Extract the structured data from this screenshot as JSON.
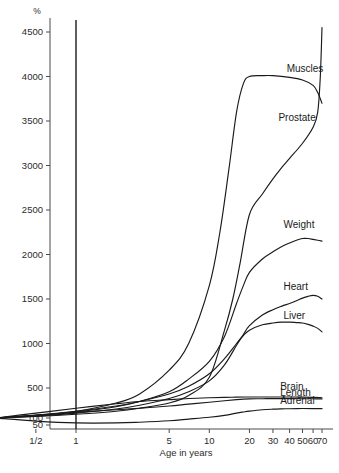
{
  "chart_data": {
    "type": "line",
    "title": "",
    "xlabel": "Age in years",
    "ylabel": "%",
    "xscale": "log",
    "yscale": "linear",
    "ylim": [
      50,
      4700
    ],
    "xlim": [
      0.25,
      75
    ],
    "grid": false,
    "legend": "inline-labels",
    "y_ticks": [
      {
        "value": 50,
        "label": "50"
      },
      {
        "value": 100,
        "label": "100"
      },
      {
        "value": 500,
        "label": "500"
      },
      {
        "value": 1000,
        "label": "1000"
      },
      {
        "value": 1500,
        "label": "1500"
      },
      {
        "value": 2000,
        "label": "2000"
      },
      {
        "value": 2500,
        "label": "2500"
      },
      {
        "value": 3000,
        "label": "3000"
      },
      {
        "value": 3500,
        "label": "3500"
      },
      {
        "value": 4000,
        "label": "4000"
      },
      {
        "value": 4500,
        "label": "4500"
      }
    ],
    "x_ticks": [
      {
        "value": 0.5,
        "label": "1/2"
      },
      {
        "value": 1,
        "label": "1"
      },
      {
        "value": 5,
        "label": "5"
      },
      {
        "value": 10,
        "label": "10"
      },
      {
        "value": 20,
        "label": "20"
      },
      {
        "value": 30,
        "label": "30"
      },
      {
        "value": 40,
        "label": "40"
      },
      {
        "value": 50,
        "label": "50"
      },
      {
        "value": 60,
        "label": "60"
      },
      {
        "value": 70,
        "label": "70"
      }
    ],
    "birth_marker": {
      "value": 1,
      "label": ""
    },
    "series": [
      {
        "name": "Muscles",
        "label": "Muscles",
        "label_x": 38,
        "label_y": 4050,
        "x": [
          0.25,
          0.5,
          1,
          2,
          3,
          5,
          7,
          10,
          12,
          14,
          16,
          18,
          20,
          25,
          30,
          40,
          50,
          60,
          65,
          70
        ],
        "y": [
          100,
          135,
          190,
          300,
          420,
          700,
          1000,
          1650,
          2250,
          2950,
          3600,
          3920,
          4000,
          4010,
          4010,
          3990,
          3960,
          3900,
          3820,
          3700
        ]
      },
      {
        "name": "Prostate",
        "label": "Prostate",
        "label_x": 33,
        "label_y": 3500,
        "x": [
          0.25,
          0.5,
          1,
          2,
          3,
          5,
          7,
          10,
          13,
          15,
          17,
          20,
          25,
          30,
          35,
          40,
          50,
          60,
          65,
          68,
          70
        ],
        "y": [
          100,
          120,
          150,
          190,
          230,
          300,
          400,
          620,
          1150,
          1500,
          1900,
          2450,
          2680,
          2850,
          2980,
          3080,
          3250,
          3430,
          3600,
          4000,
          4550
        ]
      },
      {
        "name": "Weight",
        "label": "Weight",
        "label_x": 36,
        "label_y": 2300,
        "x": [
          0.25,
          0.5,
          1,
          2,
          3,
          5,
          7,
          10,
          13,
          16,
          18,
          20,
          25,
          30,
          35,
          40,
          45,
          50,
          55,
          60,
          65,
          70
        ],
        "y": [
          100,
          130,
          180,
          250,
          320,
          450,
          600,
          800,
          1080,
          1450,
          1650,
          1800,
          1950,
          2030,
          2090,
          2130,
          2160,
          2180,
          2180,
          2170,
          2160,
          2150
        ]
      },
      {
        "name": "Heart",
        "label": "Heart",
        "label_x": 36,
        "label_y": 1600,
        "x": [
          0.25,
          0.5,
          1,
          2,
          3,
          5,
          7,
          10,
          13,
          16,
          18,
          20,
          25,
          30,
          35,
          40,
          45,
          50,
          55,
          60,
          65,
          70
        ],
        "y": [
          100,
          125,
          165,
          220,
          270,
          360,
          450,
          580,
          760,
          980,
          1100,
          1200,
          1320,
          1380,
          1420,
          1450,
          1480,
          1510,
          1530,
          1540,
          1530,
          1500
        ]
      },
      {
        "name": "Liver",
        "label": "Liver",
        "label_x": 36,
        "label_y": 1270,
        "x": [
          0.25,
          0.5,
          1,
          2,
          3,
          5,
          7,
          10,
          13,
          16,
          18,
          20,
          25,
          30,
          35,
          40,
          45,
          50,
          55,
          60,
          65,
          70
        ],
        "y": [
          100,
          140,
          190,
          260,
          320,
          420,
          520,
          660,
          830,
          1000,
          1090,
          1150,
          1210,
          1230,
          1240,
          1240,
          1235,
          1230,
          1215,
          1195,
          1170,
          1130
        ]
      },
      {
        "name": "Brain",
        "label": "Brain",
        "label_x": 34,
        "label_y": 470,
        "x": [
          0.25,
          0.5,
          1,
          2,
          3,
          5,
          7,
          10,
          13,
          16,
          20,
          25,
          30,
          40,
          50,
          60,
          70
        ],
        "y": [
          100,
          165,
          230,
          290,
          320,
          345,
          360,
          370,
          375,
          378,
          380,
          380,
          380,
          380,
          378,
          375,
          370
        ]
      },
      {
        "name": "Length",
        "label": "Length",
        "label_x": 34,
        "label_y": 390,
        "x": [
          0.25,
          0.5,
          1,
          2,
          3,
          5,
          7,
          10,
          13,
          16,
          18,
          20,
          25,
          30,
          40,
          50,
          60,
          70
        ],
        "y": [
          100,
          135,
          175,
          210,
          230,
          260,
          285,
          310,
          330,
          345,
          352,
          355,
          357,
          358,
          358,
          357,
          356,
          355
        ]
      },
      {
        "name": "Adrenal",
        "label": "Adrenal",
        "label_x": 34,
        "label_y": 285,
        "x": [
          0.25,
          0.5,
          1,
          2,
          3,
          5,
          7,
          10,
          13,
          16,
          18,
          20,
          25,
          30,
          35,
          40,
          50,
          60,
          70
        ],
        "y": [
          100,
          78,
          65,
          65,
          70,
          80,
          92,
          110,
          135,
          165,
          180,
          192,
          210,
          218,
          222,
          224,
          226,
          226,
          225
        ]
      }
    ]
  },
  "labels": {
    "y_axis_unit": "%",
    "x_axis_title": "Age in years"
  }
}
